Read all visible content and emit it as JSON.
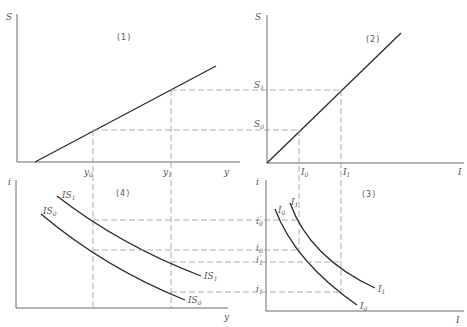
{
  "figure": {
    "panels": [
      {
        "id": "1",
        "label": "(1)",
        "x_axis": "y",
        "y_axis": "S",
        "curves": [
          {
            "name": "saving-function",
            "from": [
              0.1,
              0
            ],
            "to": [
              1.0,
              0.65
            ]
          }
        ],
        "tick_labels": {
          "x": [
            "y0",
            "y1"
          ]
        }
      },
      {
        "id": "2",
        "label": "(2)",
        "x_axis": "I",
        "y_axis": "S",
        "curves": [
          {
            "name": "45-degree-line",
            "note": "S = I"
          }
        ],
        "tick_labels": {
          "x": [
            "I0",
            "I1"
          ],
          "y": [
            "S0",
            "S1"
          ]
        }
      },
      {
        "id": "3",
        "label": "(3)",
        "x_axis": "I",
        "y_axis": "i",
        "curves": [
          {
            "name": "I0"
          },
          {
            "name": "I1"
          }
        ],
        "tick_labels": {
          "y": [
            "i0'",
            "i0",
            "i1'",
            "i1"
          ]
        }
      },
      {
        "id": "4",
        "label": "(4)",
        "x_axis": "y",
        "y_axis": "i",
        "curves": [
          {
            "name": "IS0"
          },
          {
            "name": "IS1"
          }
        ],
        "tick_labels": {
          "x": [
            "y0",
            "y1"
          ]
        }
      }
    ]
  },
  "labels": {
    "p1": {
      "title": "(1)",
      "S": "S",
      "y": "y",
      "y0": "y",
      "y0_sub": "0",
      "y1": "y",
      "y1_sub": "1"
    },
    "p2": {
      "title": "(2)",
      "S": "S",
      "I": "I",
      "S0": "S",
      "S0_sub": "0",
      "S1": "S",
      "S1_sub": "1",
      "I0": "I",
      "I0_sub": "0",
      "I1": "I",
      "I1_sub": "1"
    },
    "p3": {
      "title": "(3)",
      "i": "i",
      "I": "I",
      "i0p": "i",
      "i0p_sub": "0",
      "i0p_sup": "'",
      "i0": "i",
      "i0_sub": "0",
      "i1p": "i",
      "i1p_sub": "1",
      "i1p_sup": "'",
      "i1": "i",
      "i1_sub": "1",
      "I0c": "I",
      "I0c_sub": "0",
      "I1c": "I",
      "I1c_sub": "1",
      "I0t": "I",
      "I0t_sub": "0",
      "I1t": "I",
      "I1t_sub": "1"
    },
    "p4": {
      "title": "(4)",
      "i": "i",
      "y": "y",
      "IS0a": "IS",
      "IS0a_sub": "0",
      "IS1a": "IS",
      "IS1a_sub": "1",
      "IS0b": "IS",
      "IS0b_sub": "0",
      "IS1b": "IS",
      "IS1b_sub": "1"
    }
  }
}
